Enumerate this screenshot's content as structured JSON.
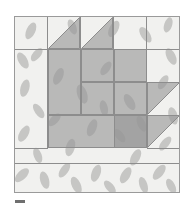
{
  "figure": {
    "kind": "quilt-block-diagram",
    "name": "Basket quilt block",
    "canvas": {
      "width": 196,
      "height": 208,
      "background": "#ffffff"
    }
  },
  "palette": {
    "background_print": "#f1f1ef",
    "leaf_print": "#c6c6c4",
    "patch_gray": "#a0a0a0",
    "seam_line": "#8d8d8d",
    "frame_line": "#9a9a9a",
    "tick_mark": "#6f6f6f"
  },
  "block": {
    "left": 14,
    "top": 16,
    "width": 166,
    "height": 177,
    "grid_columns": 5,
    "grid_rows": 5,
    "cell": 33,
    "bottom_border_height": 31
  },
  "patches": [
    {
      "id": "hst-top-left",
      "label": "half-square-triangle",
      "fabric": "patch_gray",
      "orientation": "hypotenuse-bl-tr",
      "fill_side": "lower-right"
    },
    {
      "id": "hst-top-right",
      "label": "half-square-triangle",
      "fabric": "patch_gray",
      "orientation": "hypotenuse-bl-tr",
      "fill_side": "lower-right"
    },
    {
      "id": "square-left",
      "label": "large-square",
      "fabric": "patch_gray"
    },
    {
      "id": "square-center",
      "label": "rectangle",
      "fabric": "patch_gray"
    },
    {
      "id": "square-right",
      "label": "rectangle",
      "fabric": "patch_gray"
    },
    {
      "id": "band-middle",
      "label": "wide-rectangle",
      "fabric": "patch_gray"
    },
    {
      "id": "band-bottom",
      "label": "wide-rectangle",
      "fabric": "patch_gray"
    },
    {
      "id": "hst-right-upper",
      "label": "half-square-triangle",
      "fabric": "patch_gray",
      "orientation": "hypotenuse-bl-tr",
      "fill_side": "upper-left"
    },
    {
      "id": "hst-right-lower",
      "label": "half-square-triangle",
      "fabric": "patch_gray",
      "orientation": "hypotenuse-bl-tr",
      "fill_side": "upper-left"
    }
  ],
  "borders": {
    "left": {
      "label": "left-sashing",
      "fabric": "background_print"
    },
    "top": {
      "label": "top-sashing",
      "fabric": "background_print"
    },
    "right": {
      "label": "right-sashing",
      "fabric": "background_print"
    },
    "bottom": {
      "label": "bottom-sashing",
      "fabric": "background_print"
    }
  },
  "caption": {
    "tick": ""
  }
}
